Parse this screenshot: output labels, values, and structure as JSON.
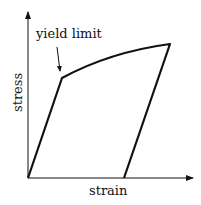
{
  "diagram": {
    "x_axis_label": "strain",
    "y_axis_label": "stress",
    "annotation": "yield limit",
    "colors": {
      "line": "#111111",
      "axis": "#111111",
      "background": "#ffffff"
    }
  }
}
